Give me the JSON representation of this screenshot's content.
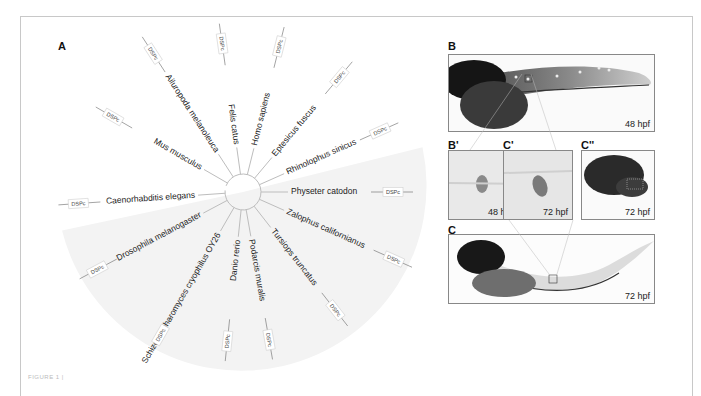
{
  "figure": {
    "caption_fragment": "FIGURE 1 |",
    "panels": {
      "A": {
        "label": "A",
        "tree_type": "circular phylogenetic tree",
        "gene_label": "DSPc",
        "taxa": [
          {
            "name": "Mus musculus",
            "angle": -150
          },
          {
            "name": "Ailuropoda melanoleuca",
            "angle": -123
          },
          {
            "name": "Felis catus",
            "angle": -98
          },
          {
            "name": "Homo sapiens",
            "angle": -76
          },
          {
            "name": "Eptesicus fuscus",
            "angle": -50
          },
          {
            "name": "Rhinolophus sinicus",
            "angle": -24
          },
          {
            "name": "Physeter catodon",
            "angle": 0
          },
          {
            "name": "Zalophus californianus",
            "angle": 24
          },
          {
            "name": "Tursiops truncatus",
            "angle": 52
          },
          {
            "name": "Podarcis muralis",
            "angle": 80
          },
          {
            "name": "Danio rerio",
            "angle": 96
          },
          {
            "name": "Schizosaccharomyces cryophilus OY26",
            "angle": 120
          },
          {
            "name": "Drosophila melanogaster",
            "angle": 152
          },
          {
            "name": "Caenorhabditis elegans",
            "angle": 176
          }
        ]
      },
      "B": {
        "label": "B",
        "stage": "48 hpf"
      },
      "B_prime": {
        "label": "B'",
        "stage": "48 hpf"
      },
      "C_prime": {
        "label": "C'",
        "stage": "72 hpf"
      },
      "C_double_prime": {
        "label": "C''",
        "stage": "72 hpf"
      },
      "C": {
        "label": "C",
        "stage": "72 hpf"
      }
    },
    "colors": {
      "branch": "#bdbdbd",
      "label_box": "#d0d0d0",
      "sector_shade": "#f3f3f3",
      "frame": "#c8c8c8",
      "stain_dark": "#1e1e1e"
    }
  }
}
